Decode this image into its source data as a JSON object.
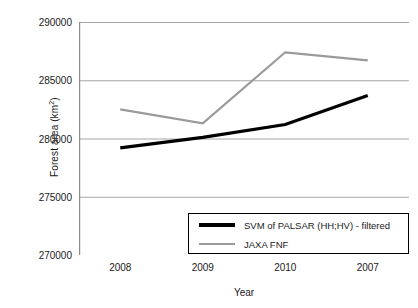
{
  "chart_data": {
    "type": "line",
    "title": "",
    "xlabel": "Year",
    "ylabel": "Forest area (km2)",
    "ylabel_base": "Forest area (km",
    "ylabel_sup": "2",
    "ylabel_tail": ")",
    "categories": [
      "2008",
      "2009",
      "2010",
      "2007"
    ],
    "ylim": [
      270000,
      290000
    ],
    "yticks": [
      290000,
      285000,
      280000,
      275000,
      270000
    ],
    "ytick_labels": [
      "290000",
      "285000",
      "280000",
      "275000",
      "270000"
    ],
    "grid": true,
    "grid_axis": "y",
    "legend_position": "lower-right-inside",
    "series": [
      {
        "name": "SVM of PALSAR (HH;HV) - filtered",
        "color": "#000000",
        "width": 3.2,
        "values": [
          279200,
          280100,
          281200,
          283700
        ]
      },
      {
        "name": "JAXA FNF",
        "color": "#9a9a9a",
        "width": 2.2,
        "values": [
          282500,
          281300,
          287400,
          286700
        ]
      }
    ]
  },
  "axis": {
    "line_color": "#8c8c8c",
    "grid_color": "#a6a6a6"
  }
}
